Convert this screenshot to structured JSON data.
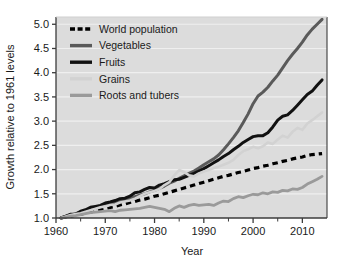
{
  "chart_data": {
    "type": "line",
    "title": "",
    "xlabel": "Year",
    "ylabel": "Growth relative to 1961 levels",
    "xlim": [
      1960,
      2015
    ],
    "ylim": [
      1.0,
      5.15
    ],
    "grid": true,
    "legend_position": "top-left",
    "xticks": [
      1960,
      1970,
      1980,
      1990,
      2000,
      2010
    ],
    "xtick_labels": [
      "1960",
      "1970",
      "1980",
      "1990",
      "2000",
      "2010"
    ],
    "xminor_ticks": [
      1965,
      1975,
      1985,
      1995,
      2005
    ],
    "yticks": [
      1.0,
      1.5,
      2.0,
      2.5,
      3.0,
      3.5,
      4.0,
      4.5,
      5.0
    ],
    "ytick_labels": [
      "1.0",
      "1.5",
      "2.0",
      "2.5",
      "3.0",
      "3.5",
      "4.0",
      "4.5",
      "5.0"
    ],
    "x": [
      1961,
      1962,
      1963,
      1964,
      1965,
      1966,
      1967,
      1968,
      1969,
      1970,
      1971,
      1972,
      1973,
      1974,
      1975,
      1976,
      1977,
      1978,
      1979,
      1980,
      1981,
      1982,
      1983,
      1984,
      1985,
      1986,
      1987,
      1988,
      1989,
      1990,
      1991,
      1992,
      1993,
      1994,
      1995,
      1996,
      1997,
      1998,
      1999,
      2000,
      2001,
      2002,
      2003,
      2004,
      2005,
      2006,
      2007,
      2008,
      2009,
      2010,
      2011,
      2012,
      2013,
      2014
    ],
    "series": [
      {
        "name": "World population",
        "color": "#000000",
        "style": "dashed",
        "width": 3.2,
        "values": [
          1.0,
          1.02,
          1.04,
          1.06,
          1.08,
          1.1,
          1.12,
          1.15,
          1.17,
          1.19,
          1.22,
          1.24,
          1.27,
          1.29,
          1.32,
          1.34,
          1.37,
          1.39,
          1.42,
          1.45,
          1.47,
          1.5,
          1.53,
          1.56,
          1.59,
          1.62,
          1.65,
          1.68,
          1.71,
          1.74,
          1.77,
          1.8,
          1.83,
          1.86,
          1.88,
          1.91,
          1.94,
          1.96,
          1.99,
          2.02,
          2.04,
          2.07,
          2.09,
          2.12,
          2.14,
          2.17,
          2.19,
          2.22,
          2.24,
          2.26,
          2.29,
          2.31,
          2.32,
          2.33
        ]
      },
      {
        "name": "Vegetables",
        "color": "#5a5a5a",
        "style": "solid",
        "width": 3.0,
        "values": [
          1.0,
          1.03,
          1.06,
          1.09,
          1.12,
          1.15,
          1.18,
          1.2,
          1.23,
          1.26,
          1.29,
          1.31,
          1.34,
          1.37,
          1.4,
          1.44,
          1.47,
          1.5,
          1.54,
          1.57,
          1.61,
          1.66,
          1.72,
          1.76,
          1.82,
          1.87,
          1.92,
          1.97,
          2.03,
          2.1,
          2.16,
          2.22,
          2.3,
          2.41,
          2.53,
          2.66,
          2.8,
          2.97,
          3.15,
          3.36,
          3.52,
          3.6,
          3.7,
          3.83,
          3.95,
          4.1,
          4.25,
          4.38,
          4.5,
          4.63,
          4.78,
          4.9,
          5.0,
          5.1
        ]
      },
      {
        "name": "Fruits",
        "color": "#111111",
        "style": "solid",
        "width": 3.0,
        "values": [
          1.0,
          1.04,
          1.08,
          1.08,
          1.14,
          1.17,
          1.22,
          1.24,
          1.26,
          1.31,
          1.33,
          1.36,
          1.4,
          1.41,
          1.45,
          1.52,
          1.54,
          1.59,
          1.63,
          1.62,
          1.68,
          1.71,
          1.75,
          1.79,
          1.8,
          1.84,
          1.88,
          1.92,
          1.97,
          2.02,
          2.08,
          2.14,
          2.2,
          2.27,
          2.33,
          2.41,
          2.48,
          2.56,
          2.62,
          2.68,
          2.7,
          2.7,
          2.76,
          2.88,
          3.02,
          3.1,
          3.13,
          3.22,
          3.33,
          3.44,
          3.55,
          3.62,
          3.74,
          3.85
        ]
      },
      {
        "name": "Grains",
        "color": "#d2d2d2",
        "style": "solid",
        "width": 2.6,
        "values": [
          1.0,
          1.03,
          1.06,
          1.08,
          1.1,
          1.13,
          1.16,
          1.19,
          1.22,
          1.24,
          1.27,
          1.28,
          1.32,
          1.34,
          1.36,
          1.4,
          1.45,
          1.5,
          1.53,
          1.56,
          1.6,
          1.68,
          1.74,
          1.88,
          1.99,
          1.95,
          1.88,
          1.86,
          1.92,
          1.96,
          1.99,
          2.03,
          2.06,
          2.1,
          2.14,
          2.2,
          2.3,
          2.38,
          2.42,
          2.47,
          2.44,
          2.48,
          2.56,
          2.53,
          2.62,
          2.7,
          2.66,
          2.78,
          2.86,
          2.82,
          2.95,
          3.02,
          3.1,
          3.18
        ]
      },
      {
        "name": "Roots and tubers",
        "color": "#9a9a9a",
        "style": "solid",
        "width": 2.8,
        "values": [
          1.0,
          1.02,
          1.04,
          1.05,
          1.07,
          1.09,
          1.11,
          1.12,
          1.13,
          1.14,
          1.15,
          1.13,
          1.16,
          1.17,
          1.18,
          1.19,
          1.2,
          1.22,
          1.24,
          1.22,
          1.2,
          1.18,
          1.13,
          1.2,
          1.25,
          1.22,
          1.26,
          1.28,
          1.26,
          1.27,
          1.28,
          1.26,
          1.31,
          1.35,
          1.34,
          1.4,
          1.44,
          1.42,
          1.46,
          1.49,
          1.48,
          1.52,
          1.5,
          1.54,
          1.53,
          1.57,
          1.56,
          1.6,
          1.59,
          1.63,
          1.7,
          1.75,
          1.8,
          1.86
        ]
      }
    ]
  },
  "legend": {
    "entries": [
      {
        "label": "World population"
      },
      {
        "label": "Vegetables"
      },
      {
        "label": "Fruits"
      },
      {
        "label": "Grains"
      },
      {
        "label": "Roots and tubers"
      }
    ]
  },
  "style": {
    "plot_background": "#dcdcdc",
    "page_background": "#ffffff",
    "gridline_color": "#efefef",
    "axis_color": "#3c3c3c",
    "text_color": "#1a1a1a"
  }
}
